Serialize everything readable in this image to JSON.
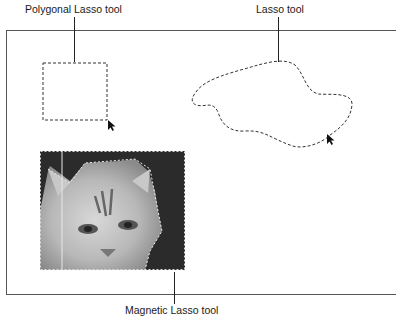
{
  "callouts": {
    "polygonal_lasso": "Polygonal Lasso tool",
    "lasso": "Lasso tool",
    "magnetic_lasso": "Magnetic Lasso tool"
  },
  "illustration": {
    "image_subject": "cat photo with magnetic lasso selection",
    "colors": {
      "line": "#222222",
      "marquee": "#333333",
      "background": "#ffffff"
    }
  }
}
